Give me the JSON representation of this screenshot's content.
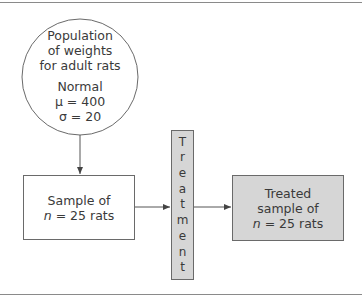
{
  "diagram": {
    "population": {
      "line1": "Population",
      "line2": "of weights",
      "line3": "for adult rats",
      "distribution": "Normal",
      "mu": "μ = 400",
      "sigma": "σ = 20"
    },
    "sample": {
      "line1": "Sample of",
      "n_symbol": "n",
      "n_value": " = 25 rats"
    },
    "treatment": {
      "letters": [
        "T",
        "r",
        "e",
        "a",
        "t",
        "m",
        "e",
        "n",
        "t"
      ]
    },
    "treated_sample": {
      "line1": "Treated",
      "line2": "sample of",
      "n_symbol": "n",
      "n_value": " = 25 rats"
    },
    "colors": {
      "shaded_fill": "#d6d6d6",
      "line": "#6a6a6a"
    }
  }
}
